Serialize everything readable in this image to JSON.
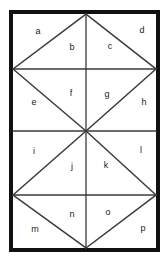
{
  "figure": {
    "kind": "geometric-diagram",
    "canvas": {
      "width": 168,
      "height": 262
    },
    "colors": {
      "background": "#ffffff",
      "border": "#111111",
      "grid_line": "#3a3a3a",
      "diagonal_line": "#3a3a3a",
      "label_text": "#1a1a1a"
    },
    "border": {
      "x": 11,
      "y": 12,
      "width": 147,
      "height": 238,
      "stroke_width": 4
    },
    "geometry": {
      "left": 13,
      "right": 156,
      "top": 14,
      "bottom": 248,
      "center_x": 86,
      "horizontal_lines_y": [
        69,
        131,
        195
      ],
      "band_rows": 4
    },
    "regions": [
      {
        "id": "a",
        "label": "a",
        "x": 38,
        "y": 32,
        "shape": "triangle",
        "band": 1
      },
      {
        "id": "b",
        "label": "b",
        "x": 72,
        "y": 48,
        "shape": "triangle",
        "band": 1
      },
      {
        "id": "c",
        "label": "c",
        "x": 110,
        "y": 47,
        "shape": "triangle",
        "band": 1
      },
      {
        "id": "d",
        "label": "d",
        "x": 142,
        "y": 31,
        "shape": "triangle",
        "band": 1
      },
      {
        "id": "e",
        "label": "e",
        "x": 34,
        "y": 103,
        "shape": "triangle",
        "band": 2
      },
      {
        "id": "f",
        "label": "f",
        "x": 71,
        "y": 94,
        "shape": "triangle",
        "band": 2
      },
      {
        "id": "g",
        "label": "g",
        "x": 107,
        "y": 95,
        "shape": "triangle",
        "band": 2
      },
      {
        "id": "h",
        "label": "h",
        "x": 144,
        "y": 103,
        "shape": "triangle",
        "band": 2
      },
      {
        "id": "i",
        "label": "i",
        "x": 34,
        "y": 152,
        "shape": "triangle",
        "band": 3
      },
      {
        "id": "j",
        "label": "j",
        "x": 72,
        "y": 167,
        "shape": "triangle",
        "band": 3
      },
      {
        "id": "k",
        "label": "k",
        "x": 106,
        "y": 166,
        "shape": "triangle",
        "band": 3
      },
      {
        "id": "l",
        "label": "l",
        "x": 141,
        "y": 151,
        "shape": "triangle",
        "band": 3
      },
      {
        "id": "m",
        "label": "m",
        "x": 35,
        "y": 230,
        "shape": "triangle",
        "band": 4
      },
      {
        "id": "n",
        "label": "n",
        "x": 72,
        "y": 215,
        "shape": "triangle",
        "band": 4
      },
      {
        "id": "o",
        "label": "o",
        "x": 108,
        "y": 213,
        "shape": "triangle",
        "band": 4
      },
      {
        "id": "p",
        "label": "p",
        "x": 143,
        "y": 229,
        "shape": "triangle",
        "band": 4
      }
    ],
    "lines": {
      "horizontals": [
        {
          "name": "grid-line-1",
          "x1": 13,
          "y1": 69,
          "x2": 156,
          "y2": 69
        },
        {
          "name": "grid-line-2",
          "x1": 13,
          "y1": 131,
          "x2": 156,
          "y2": 131
        },
        {
          "name": "grid-line-3",
          "x1": 13,
          "y1": 195,
          "x2": 156,
          "y2": 195
        }
      ],
      "verticals": [
        {
          "name": "center-vertical",
          "x1": 86,
          "y1": 14,
          "x2": 86,
          "y2": 248
        }
      ],
      "diagonals": [
        {
          "name": "diag-band1-left-up",
          "x1": 13,
          "y1": 69,
          "x2": 86,
          "y2": 14
        },
        {
          "name": "diag-band1-right-down",
          "x1": 86,
          "y1": 14,
          "x2": 156,
          "y2": 69
        },
        {
          "name": "diag-band2-left-down",
          "x1": 13,
          "y1": 69,
          "x2": 86,
          "y2": 131
        },
        {
          "name": "diag-band2-right-up",
          "x1": 86,
          "y1": 131,
          "x2": 156,
          "y2": 69
        },
        {
          "name": "diag-band3-left-up",
          "x1": 13,
          "y1": 195,
          "x2": 86,
          "y2": 131
        },
        {
          "name": "diag-band3-right-down",
          "x1": 86,
          "y1": 131,
          "x2": 156,
          "y2": 195
        },
        {
          "name": "diag-band4-left-down",
          "x1": 13,
          "y1": 195,
          "x2": 86,
          "y2": 248
        },
        {
          "name": "diag-band4-right-up",
          "x1": 86,
          "y1": 248,
          "x2": 156,
          "y2": 195
        }
      ]
    }
  }
}
